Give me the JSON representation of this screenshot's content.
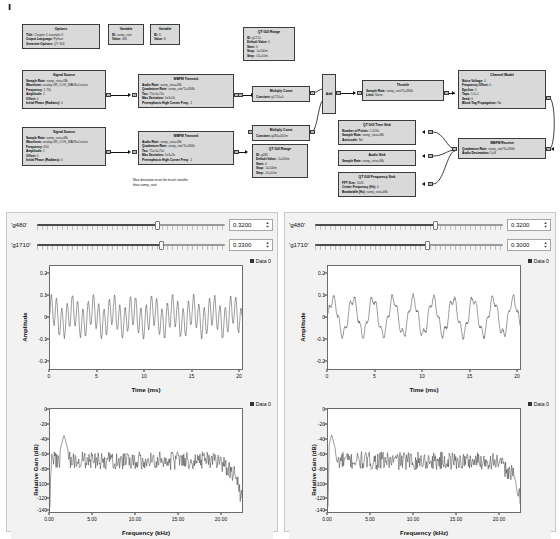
{
  "page_mark": "I",
  "flowgraph": {
    "blocks": [
      {
        "id": "options",
        "title": "Options",
        "rows": [
          {
            "key": "Title:",
            "val": "Chapter 2 example 3"
          },
          {
            "key": "Output Language:",
            "val": "Python"
          },
          {
            "key": "Generate Options:",
            "val": "QT GUI"
          }
        ]
      },
      {
        "id": "variable-samp-rate",
        "title": "Variable",
        "rows": [
          {
            "key": "ID:",
            "val": "samp_rate"
          },
          {
            "key": "Value:",
            "val": "48k"
          }
        ]
      },
      {
        "id": "variable-d",
        "title": "Variable",
        "rows": [
          {
            "key": "ID:",
            "val": "D"
          },
          {
            "key": "Value:",
            "val": "8"
          }
        ]
      },
      {
        "id": "signal-source-1710",
        "title": "Signal Source",
        "rows": [
          {
            "key": "Sample Rate:",
            "val": "samp_rate=48k"
          },
          {
            "key": "Waveform:",
            "val": "analog.GR_COS_WAVE=Cosine"
          },
          {
            "key": "Frequency:",
            "val": "1.71k"
          },
          {
            "key": "Amplitude:",
            "val": "1"
          },
          {
            "key": "Offset:",
            "val": "0"
          },
          {
            "key": "Initial Phase (Radians):",
            "val": "0"
          }
        ]
      },
      {
        "id": "signal-source-450",
        "title": "Signal Source",
        "rows": [
          {
            "key": "Sample Rate:",
            "val": "samp_rate=48k"
          },
          {
            "key": "Waveform:",
            "val": "analog.GR_COS_WAVE=Cosine"
          },
          {
            "key": "Frequency:",
            "val": "450"
          },
          {
            "key": "Amplitude:",
            "val": "1"
          },
          {
            "key": "Offset:",
            "val": "0"
          },
          {
            "key": "Initial Phase (Radians):",
            "val": "0"
          }
        ]
      },
      {
        "id": "wbfm-transmit-1",
        "title": "WBFM Transmit",
        "rows": [
          {
            "key": "Audio Rate:",
            "val": "samp_rate=48k"
          },
          {
            "key": "Quadrature Rate:",
            "val": "samp_rate*D=384k"
          },
          {
            "key": "Tau:",
            "val": "75e-6=75u"
          },
          {
            "key": "Max Deviation:",
            "val": "5e3=5k"
          },
          {
            "key": "Preemphasis High Corner Freq:",
            "val": "-1"
          }
        ]
      },
      {
        "id": "wbfm-transmit-2",
        "title": "WBFM Transmit",
        "rows": [
          {
            "key": "Audio Rate:",
            "val": "samp_rate=48k"
          },
          {
            "key": "Quadrature Rate:",
            "val": "samp_rate*D=384k"
          },
          {
            "key": "Tau:",
            "val": "75e-6=75u"
          },
          {
            "key": "Max Deviation:",
            "val": "5e3=5k"
          },
          {
            "key": "Preemphasis High Corner Freq:",
            "val": "-1"
          }
        ]
      },
      {
        "id": "qt-gui-range-g1710",
        "title": "QT GUI Range",
        "rows": [
          {
            "key": "ID:",
            "val": "g1710"
          },
          {
            "key": "Default Value:",
            "val": "0"
          },
          {
            "key": "Start:",
            "val": "0"
          },
          {
            "key": "Stop:",
            "val": ".5=500m"
          },
          {
            "key": "Step:",
            "val": ".01=10m"
          }
        ]
      },
      {
        "id": "qt-gui-range-g480",
        "title": "QT GUI Range",
        "rows": [
          {
            "key": "ID:",
            "val": "g480"
          },
          {
            "key": "Default Value:",
            "val": ".5=500m"
          },
          {
            "key": "Start:",
            "val": "0"
          },
          {
            "key": "Stop:",
            "val": ".5=500m"
          },
          {
            "key": "Step:",
            "val": ".01=10m"
          }
        ]
      },
      {
        "id": "multiply-const-1710",
        "title": "Multiply Const",
        "rows": [
          {
            "key": "Constant:",
            "val": "g1710=0"
          }
        ]
      },
      {
        "id": "multiply-const-480",
        "title": "Multiply Const",
        "rows": [
          {
            "key": "Constant:",
            "val": "g480=400m"
          }
        ]
      },
      {
        "id": "add",
        "title": "Add",
        "rows": []
      },
      {
        "id": "throttle",
        "title": "Throttle",
        "rows": [
          {
            "key": "Sample Rate:",
            "val": "samp_rate*D=384k"
          },
          {
            "key": "Limit:",
            "val": "None"
          }
        ]
      },
      {
        "id": "channel-model",
        "title": "Channel Model",
        "rows": [
          {
            "key": "Noise Voltage:",
            "val": "0"
          },
          {
            "key": "Frequency Offset:",
            "val": "0"
          },
          {
            "key": "Epsilon:",
            "val": "1"
          },
          {
            "key": "Taps:",
            "val": "1,0+1"
          },
          {
            "key": "Seed:",
            "val": "0"
          },
          {
            "key": "Block Tag Propagation:",
            "val": "No"
          }
        ]
      },
      {
        "id": "wbfm-receive",
        "title": "WBFM Receive",
        "rows": [
          {
            "key": "Quadrature Rate:",
            "val": "samp_rate*D=384k"
          },
          {
            "key": "Audio Decimation:",
            "val": "D=8"
          }
        ]
      },
      {
        "id": "qt-gui-time-sink",
        "title": "QT GUI Time Sink",
        "rows": [
          {
            "key": "Number of Points:",
            "val": "1.024k"
          },
          {
            "key": "Sample Rate:",
            "val": "samp_rate=48k"
          },
          {
            "key": "Autoscale:",
            "val": "No"
          }
        ]
      },
      {
        "id": "audio-sink",
        "title": "Audio Sink",
        "rows": [
          {
            "key": "Sample Rate:",
            "val": "samp_rate=48k"
          }
        ]
      },
      {
        "id": "qt-gui-frequency-sink",
        "title": "QT GUI Frequency Sink",
        "rows": [
          {
            "key": "FFT Size:",
            "val": "1024"
          },
          {
            "key": "Center Frequency (Hz):",
            "val": "0"
          },
          {
            "key": "Bandwidth (Hz):",
            "val": "samp_rate=48k"
          }
        ]
      }
    ],
    "note": "Max deviation must be much smaller\nthan samp_rate"
  },
  "gui_windows": [
    {
      "id": "gui-left",
      "sliders": [
        {
          "label": "'g480'",
          "value": "0.3200",
          "fraction": 0.64
        },
        {
          "label": "'g1710'",
          "value": "0.3300",
          "fraction": 0.66
        }
      ],
      "time_plot": {
        "legend": "Data 0",
        "ylabel": "Amplitude",
        "xlabel": "Time (ms)",
        "yticks": [
          "0.2",
          "0.1",
          "0",
          "-0.1",
          "-0.2"
        ],
        "ylim": [
          -0.25,
          0.25
        ],
        "xticks": [
          "0",
          "5",
          "10",
          "15",
          "20"
        ],
        "xlim": [
          0,
          21.3
        ]
      },
      "freq_plot": {
        "legend": "Data 0",
        "ylabel": "Relative Gain (dB)",
        "xlabel": "Frequency (kHz)",
        "yticks": [
          "0",
          "-20",
          "-40",
          "-60",
          "-80",
          "-100",
          "-120",
          "-140"
        ],
        "ylim": [
          -145,
          2
        ],
        "xticks": [
          "0.00",
          "5.00",
          "10.00",
          "15.00",
          "20.00"
        ],
        "xlim": [
          0,
          23.5
        ],
        "annotation": "1.72 kHz, -34.48 dB"
      }
    },
    {
      "id": "gui-right",
      "sliders": [
        {
          "label": "'g480'",
          "value": "0.3200",
          "fraction": 0.64
        },
        {
          "label": "'g1710'",
          "value": "0.3000",
          "fraction": 0.6
        }
      ],
      "time_plot": {
        "legend": "Data 0",
        "ylabel": "Amplitude",
        "xlabel": "Time (ms)",
        "yticks": [
          "0.2",
          "0.1",
          "0",
          "-0.1",
          "-0.2"
        ],
        "ylim": [
          -0.25,
          0.25
        ],
        "xticks": [
          "0",
          "5",
          "10",
          "15",
          "20"
        ],
        "xlim": [
          0,
          21.3
        ]
      },
      "freq_plot": {
        "legend": "Data 0",
        "ylabel": "Relative Gain (dB)",
        "xlabel": "Frequency (kHz)",
        "yticks": [
          "0",
          "-20",
          "-40",
          "-60",
          "-80",
          "-100",
          "-120",
          "-140"
        ],
        "ylim": [
          -145,
          2
        ],
        "xticks": [
          "0.00",
          "5.00",
          "10.00",
          "15.00",
          "20.00"
        ],
        "xlim": [
          0,
          23.5
        ],
        "annotation": "0.45 kHz, -34.48 dB"
      }
    }
  ],
  "colors": {
    "block_fill": "#d9d9d9",
    "block_border": "#3b3b3b",
    "trace": "#333333",
    "window_bg": "#f2f2f2"
  }
}
